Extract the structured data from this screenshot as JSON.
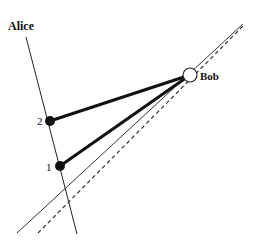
{
  "diagram": {
    "axis_label": "Alice",
    "node_label": "Bob",
    "points": [
      {
        "label": "1",
        "x": 60,
        "y": 166
      },
      {
        "label": "2",
        "x": 50,
        "y": 121
      }
    ],
    "bob": {
      "x": 190,
      "y": 75,
      "r": 7
    },
    "alice_axis": {
      "x1": 26,
      "y1": 37,
      "x2": 77,
      "y2": 234
    },
    "solid_line": {
      "x1": 17,
      "y1": 233,
      "x2": 243,
      "y2": 24
    },
    "dashed_line": {
      "x1": 38,
      "y1": 233,
      "x2": 243,
      "y2": 26
    },
    "colors": {
      "stroke": "#111111",
      "fill_bob": "#ffffff"
    }
  }
}
